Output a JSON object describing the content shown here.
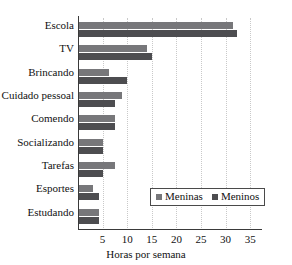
{
  "chart_data": {
    "type": "bar",
    "orientation": "horizontal",
    "title": "",
    "xlabel": "Horas por semana",
    "ylabel": "",
    "xlim": [
      0,
      37
    ],
    "xticks": [
      5,
      10,
      15,
      20,
      25,
      30,
      35
    ],
    "grid": "vertical-dotted",
    "legend_position": "inside-bottom-right",
    "categories": [
      "Escola",
      "TV",
      "Brincando",
      "Cuidado pessoal",
      "Comendo",
      "Socializando",
      "Tarefas",
      "Esportes",
      "Estudando"
    ],
    "series": [
      {
        "name": "Meninas",
        "color": "#77777a",
        "values": [
          31.5,
          14.0,
          6.3,
          9.0,
          7.5,
          5.0,
          7.5,
          3.0,
          4.3
        ]
      },
      {
        "name": "Meninos",
        "color": "#4d4d50",
        "values": [
          32.3,
          15.0,
          10.0,
          7.5,
          7.5,
          5.0,
          5.0,
          4.3,
          4.3
        ]
      }
    ]
  },
  "axes": {
    "x_tick_labels": [
      "5",
      "10",
      "15",
      "20",
      "25",
      "30",
      "35"
    ],
    "x_axis_title": "Horas por semana"
  },
  "legend": {
    "items": [
      {
        "label": "Meninas",
        "color": "#77777a"
      },
      {
        "label": "Meninos",
        "color": "#4d4d50"
      }
    ]
  },
  "top_fragment": {
    "text": ""
  }
}
